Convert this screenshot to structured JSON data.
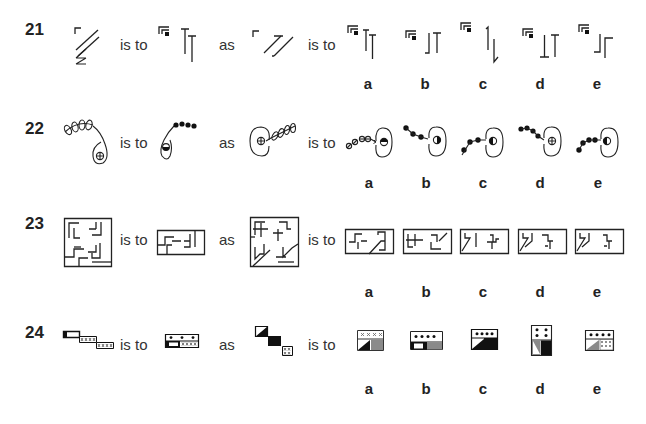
{
  "questions": [
    {
      "number": "21",
      "words": {
        "is_to_1": "is to",
        "as": "as",
        "is_to_2": "is to"
      },
      "figures": {
        "A": "corner-bracket-with-double-slash-and-z",
        "B": "double-corner-bracket-with-square-and-two-T-bars",
        "C": "corner-bracket-with-z-double-slash",
        "options": [
          "bracket-square-two-T-bars",
          "bracket-square-hooked-bar-and-T",
          "bracket-square-hook-and-arrow-down",
          "bracket-square-inverted-T-and-T",
          "bracket-square-hooked-bar-and-corner"
        ]
      },
      "option_labels": [
        "a",
        "b",
        "c",
        "d",
        "e"
      ]
    },
    {
      "number": "22",
      "words": {
        "is_to_1": "is to",
        "as": "as",
        "is_to_2": "is to"
      },
      "figures": {
        "A": "cell-with-crossed-circle-and-loopy-chain",
        "B": "cell-with-half-filled-circle-and-bead-chain",
        "C": "round-cell-with-crossed-circle-and-loops-right",
        "options": [
          "cell-half-top-filled-hollow-chain",
          "cell-half-right-filled-bead-chain",
          "cell-half-left-filled-rising-beads",
          "cell-crossed-circle-bead-chain",
          "cell-half-left-filled-rising-beads-alt"
        ]
      },
      "option_labels": [
        "a",
        "b",
        "c",
        "d",
        "e"
      ]
    },
    {
      "number": "23",
      "words": {
        "is_to_1": "is to",
        "as": "as",
        "is_to_2": "is to"
      },
      "figures": {
        "A": "square-maze",
        "B": "rectangle-maze-half",
        "C": "square-maze-with-diagonal",
        "options": [
          "rect-maze-a",
          "rect-maze-b",
          "rect-maze-c",
          "rect-maze-d",
          "rect-maze-e"
        ]
      },
      "option_labels": [
        "a",
        "b",
        "c",
        "d",
        "e"
      ]
    },
    {
      "number": "24",
      "words": {
        "is_to_1": "is to",
        "as": "as",
        "is_to_2": "is to"
      },
      "figures": {
        "A": "three-staircase-tiles-open-hatched-hatched",
        "B": "tile-with-three-dots-open-and-hatched",
        "C": "three-staircase-tiles-diagonal-black-hatched",
        "options": [
          "tile-xxxx-diagonal-grey",
          "tile-four-dots-white-grey",
          "tile-four-dots-diagonal-black",
          "tall-tile-four-dots-diagonal-black",
          "tile-four-dots-diagonal-hatched"
        ]
      },
      "option_labels": [
        "a",
        "b",
        "c",
        "d",
        "e"
      ]
    }
  ]
}
